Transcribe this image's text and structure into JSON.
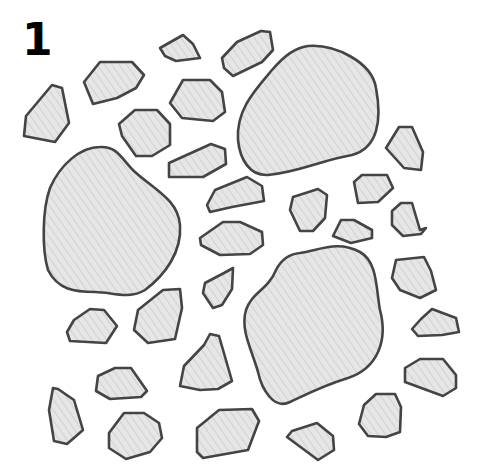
{
  "figure": {
    "label": "1",
    "colors": {
      "fill": "#e6e6e6",
      "hatch": "#d2d2d2",
      "stroke": "#444444",
      "background": "#ffffff"
    },
    "large_shapes": [
      {
        "name": "large-blob-top-right",
        "d": "M 308 46 C 335 44 372 62 376 88 C 382 120 378 148 352 155 C 322 160 300 172 268 175 C 250 176 240 160 238 140 C 236 110 255 90 272 70 C 285 55 295 48 308 46 Z"
      },
      {
        "name": "large-blob-left",
        "d": "M 100 147 C 118 146 122 160 135 172 C 155 190 178 200 180 225 C 182 252 165 275 145 290 C 128 300 112 292 95 292 C 75 292 58 290 48 270 C 42 250 42 210 50 188 C 60 165 80 147 100 147 Z"
      },
      {
        "name": "large-blob-bottom-right",
        "d": "M 300 253 C 320 250 338 240 360 252 C 378 262 376 290 380 310 C 388 340 378 368 348 378 C 322 386 305 395 290 402 C 274 410 262 390 258 372 C 252 350 240 330 246 310 C 252 292 268 290 276 270 C 282 258 290 254 300 253 Z"
      }
    ],
    "small_shapes": [
      {
        "name": "poly-1",
        "points": "52,85 62,88 69,123 55,142 24,136 26,116"
      },
      {
        "name": "poly-2",
        "points": "100,62 132,62 144,75 136,88 117,98 93,104 84,82"
      },
      {
        "name": "poly-3",
        "points": "183,35 193,44 200,58 176,61 165,56 160,48"
      },
      {
        "name": "poly-4",
        "points": "261,31 270,32 273,50 262,62 233,76 224,68 222,58 237,42"
      },
      {
        "name": "poly-5",
        "points": "135,110 157,110 170,124 170,145 152,156 136,156 122,136 119,124"
      },
      {
        "name": "poly-6",
        "points": "183,80 210,80 222,92 225,112 213,121 182,118 170,103"
      },
      {
        "name": "poly-7",
        "points": "211,144 225,149 226,164 203,177 169,177 169,163"
      },
      {
        "name": "poly-8",
        "points": "247,177 262,186 264,201 232,207 210,212 207,205 215,190"
      },
      {
        "name": "poly-9",
        "points": "223,222 240,222 262,232 263,245 250,254 220,255 201,245 200,238"
      },
      {
        "name": "poly-10",
        "points": "318,189 327,195 325,218 313,231 300,231 290,210 293,197"
      },
      {
        "name": "poly-11",
        "points": "362,175 387,175 393,188 378,202 358,203 354,182"
      },
      {
        "name": "poly-12",
        "points": "341,220 354,220 372,230 372,238 351,243 333,236"
      },
      {
        "name": "poly-13",
        "points": "399,127 412,127 423,152 421,170 404,168 386,148"
      },
      {
        "name": "poly-14",
        "points": "401,203 412,203 420,230 426,228 421,234 403,236 392,225 392,211"
      },
      {
        "name": "poly-15",
        "points": "396,260 424,257 431,271 436,290 420,298 400,290 392,278"
      },
      {
        "name": "poly-16",
        "points": "224,273 233,268 232,289 222,305 213,308 203,293 205,283"
      },
      {
        "name": "poly-17",
        "points": "163,290 180,289 182,308 175,339 148,343 134,330 138,310"
      },
      {
        "name": "poly-18",
        "points": "90,309 104,310 117,326 106,343 70,341 67,332 74,320"
      },
      {
        "name": "poly-19",
        "points": "210,334 219,336 232,381 218,389 200,390 180,386 184,366 204,345"
      },
      {
        "name": "poly-20",
        "points": "432,309 456,318 459,332 442,335 418,336 412,329 421,319"
      },
      {
        "name": "poly-21",
        "points": "420,359 443,359 456,375 456,388 443,396 405,382 405,368"
      },
      {
        "name": "poly-22",
        "points": "115,368 131,368 147,391 141,397 110,399 96,391 98,376"
      },
      {
        "name": "poly-23",
        "points": "53,388 58,389 74,400 83,430 67,444 54,441 49,410"
      },
      {
        "name": "poly-24",
        "points": "124,413 144,413 159,423 162,438 150,452 126,459 109,448 109,433"
      },
      {
        "name": "poly-25",
        "points": "219,410 252,409 259,421 248,450 203,458 197,452 197,428"
      },
      {
        "name": "poly-26",
        "points": "376,394 395,394 401,407 400,432 386,437 368,436 359,424 364,405"
      },
      {
        "name": "poly-27",
        "points": "317,423 333,436 334,450 318,460 287,437 292,431"
      }
    ]
  }
}
